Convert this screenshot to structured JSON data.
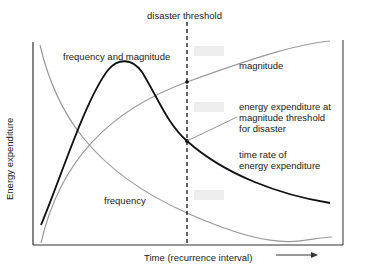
{
  "diagram": {
    "title_threshold": "disaster  threshold",
    "y_axis_label": "Energy expenditure",
    "x_axis_label": "Time (recurrence interval)",
    "curves": [
      {
        "id": "frequency-and-magnitude",
        "label": "frequency and magnitude",
        "color": "#111111",
        "style": "solid-thick"
      },
      {
        "id": "magnitude",
        "label": "magnitude",
        "color": "#9a9a9a",
        "style": "solid-thin"
      },
      {
        "id": "frequency",
        "label": "frequency",
        "color": "#9a9a9a",
        "style": "solid-thin"
      }
    ],
    "annotations": {
      "threshold_point": "energy expenditure at\nmagnitude threshold\nfor disaster",
      "time_rate": "time rate of\nenergy expenditure"
    },
    "colors": {
      "primary_curve": "#111111",
      "secondary_curve": "#9a9a9a",
      "axis": "#333333",
      "threshold_line": "#111111"
    }
  }
}
